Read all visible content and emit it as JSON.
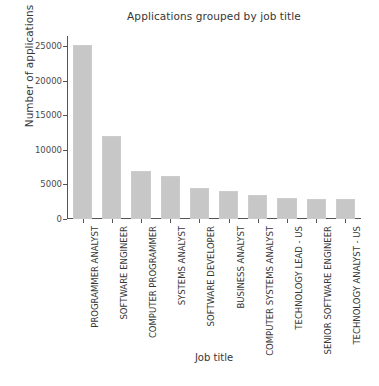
{
  "chart_data": {
    "type": "bar",
    "title": "Applications grouped by job title",
    "xlabel": "Job title",
    "ylabel": "Number of applications",
    "categories": [
      "PROGRAMMER ANALYST",
      "SOFTWARE ENGINEER",
      "COMPUTER PROGRAMMER",
      "SYSTEMS ANALYST",
      "SOFTWARE DEVELOPER",
      "BUSINESS ANALYST",
      "COMPUTER SYSTEMS ANALYST",
      "TECHNOLOGY LEAD - US",
      "SENIOR SOFTWARE ENGINEER",
      "TECHNOLOGY ANALYST - US"
    ],
    "values": [
      25200,
      12000,
      7000,
      6200,
      4500,
      4000,
      3500,
      3000,
      2850,
      2850
    ],
    "ylim": [
      0,
      26500
    ],
    "yticks": [
      0,
      5000,
      10000,
      15000,
      20000,
      25000
    ],
    "ytick_labels": [
      "0",
      "5000",
      "10000",
      "15000",
      "20000",
      "25000"
    ],
    "grid": false,
    "legend": null,
    "bar_color": "#c7c7c7",
    "axis_color": "#555555",
    "text_color": "#363636",
    "background": "#ffffff"
  }
}
